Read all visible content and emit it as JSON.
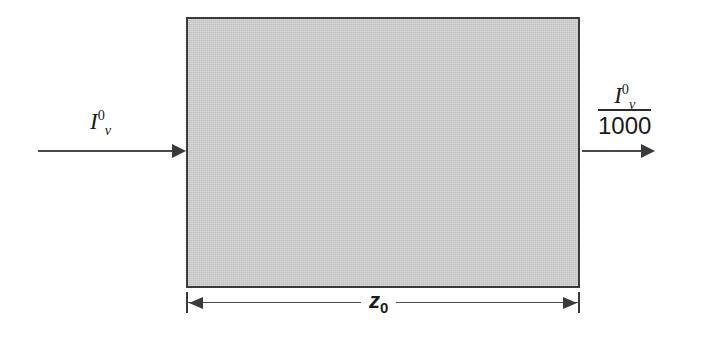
{
  "figure": {
    "type": "radiative-transfer-slab-diagram",
    "background_color": "#ffffff"
  },
  "slab": {
    "name": "absorbing-medium",
    "fill_color": "#cdcdcd",
    "border_color": "#3a3a3a"
  },
  "incoming": {
    "symbol": "I",
    "superscript": "0",
    "subscript": "ν",
    "arrow_direction": "right"
  },
  "outgoing": {
    "numerator_symbol": "I",
    "numerator_superscript": "0",
    "numerator_subscript": "ν",
    "denominator": "1000",
    "arrow_direction": "right"
  },
  "dimension": {
    "symbol": "z",
    "subscript": "0",
    "arrow_style": "double-headed"
  }
}
